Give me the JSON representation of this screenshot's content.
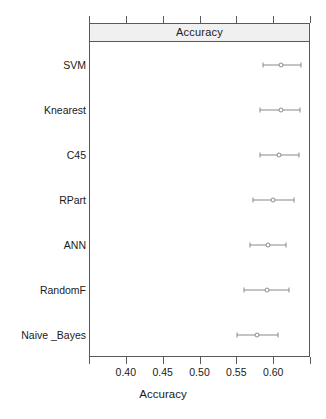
{
  "chart_data": {
    "type": "scatter",
    "plot_style": "dotplot-with-confidence-intervals",
    "title": "Accuracy",
    "strip_label": "Accuracy",
    "xlabel": "Accuracy",
    "ylabel": "",
    "grid": false,
    "legend": null,
    "xlim": [
      0.35,
      0.65
    ],
    "xticks": [
      0.35,
      0.4,
      0.45,
      0.5,
      0.55,
      0.6,
      0.65
    ],
    "xtick_labels": [
      "",
      "0.40",
      "0.45",
      "0.50",
      "0.55",
      "0.60",
      ""
    ],
    "visible_xtick_labels": [
      "0.40",
      "0.45",
      "0.50",
      "0.55",
      "0.60"
    ],
    "categories": [
      "SVM",
      "Knearest",
      "C45",
      "RPart",
      "ANN",
      "RandomF",
      "Naive _Bayes"
    ],
    "values": [
      0.61,
      0.61,
      0.608,
      0.6,
      0.593,
      0.592,
      0.578
    ],
    "lower": [
      0.586,
      0.582,
      0.582,
      0.572,
      0.568,
      0.561,
      0.551
    ],
    "upper": [
      0.638,
      0.636,
      0.635,
      0.628,
      0.617,
      0.622,
      0.606
    ],
    "points": [
      {
        "category": "SVM",
        "value": 0.61,
        "lower": 0.586,
        "upper": 0.638
      },
      {
        "category": "Knearest",
        "value": 0.61,
        "lower": 0.582,
        "upper": 0.636
      },
      {
        "category": "C45",
        "value": 0.608,
        "lower": 0.582,
        "upper": 0.635
      },
      {
        "category": "RPart",
        "value": 0.6,
        "lower": 0.572,
        "upper": 0.628
      },
      {
        "category": "ANN",
        "value": 0.593,
        "lower": 0.568,
        "upper": 0.617
      },
      {
        "category": "RandomF",
        "value": 0.592,
        "lower": 0.561,
        "upper": 0.622
      },
      {
        "category": "Naive _Bayes",
        "value": 0.578,
        "lower": 0.551,
        "upper": 0.606
      }
    ],
    "colors": {
      "point": "#8a8a8a",
      "interval": "#8a8a8a",
      "axis": "#595959",
      "strip_background": "#f0f0f0",
      "text": "#1a1a1a",
      "panel_background": "#ffffff"
    }
  }
}
